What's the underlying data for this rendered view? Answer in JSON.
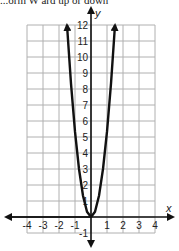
{
  "caption": "...orm   W ard up  or down",
  "chart_data": {
    "type": "line",
    "title": "",
    "xlabel": "x",
    "ylabel": "y",
    "xlim": [
      -4,
      4
    ],
    "ylim": [
      -1,
      12
    ],
    "grid": true,
    "x_tick_labels": [
      "-4",
      "-3",
      "-2",
      "-1",
      "1",
      "2",
      "3",
      "4"
    ],
    "y_tick_labels": [
      "-1",
      "1",
      "2",
      "3",
      "4",
      "5",
      "6",
      "7",
      "8",
      "9",
      "10",
      "11",
      "12"
    ],
    "series": [
      {
        "name": "parabola",
        "equation": "y = 5.33x^2",
        "x": [
          -1.5,
          -1.25,
          -1,
          -0.75,
          -0.5,
          -0.25,
          0,
          0.25,
          0.5,
          0.75,
          1,
          1.25,
          1.5
        ],
        "y": [
          12,
          8.33,
          5.33,
          3,
          1.33,
          0.33,
          0,
          0.33,
          1.33,
          3,
          5.33,
          8.33,
          12
        ],
        "arrows": "both ends",
        "color": "#111111"
      }
    ]
  },
  "colors": {
    "grid": "#b0b0b0",
    "axis": "#111111",
    "curve": "#111111"
  }
}
